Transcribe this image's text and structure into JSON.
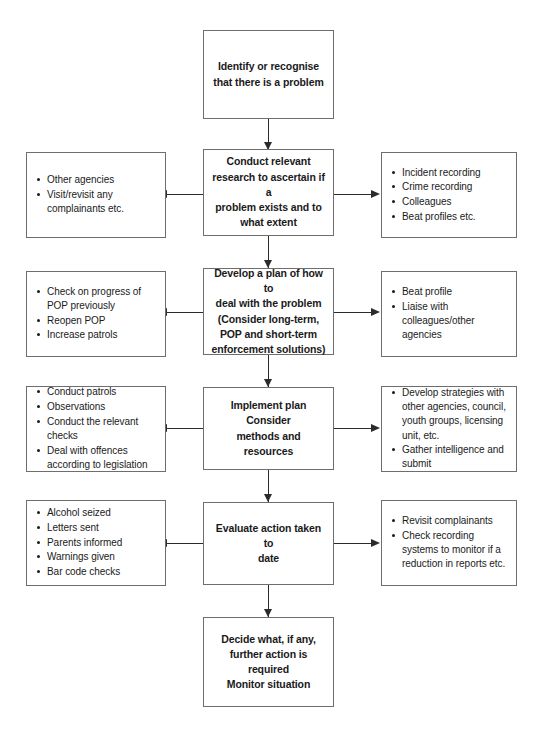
{
  "diagram": {
    "box_border_color": "#6e6e6e",
    "connector_color": "#2b2b2b",
    "background_color": "#ffffff"
  },
  "nodes": {
    "identify": {
      "lines": [
        "Identify or recognise",
        "that there is a problem"
      ]
    },
    "research": {
      "lines": [
        "Conduct relevant",
        "research to ascertain if a",
        "problem exists and to",
        "what extent"
      ]
    },
    "develop": {
      "lines": [
        "Develop a plan of how to",
        "deal with the problem",
        "(Consider long-term,",
        "POP and short-term",
        "enforcement solutions)"
      ]
    },
    "implement": {
      "lines": [
        "Implement plan",
        "Consider",
        "methods and resources"
      ]
    },
    "evaluate": {
      "lines": [
        "Evaluate action taken to",
        "date"
      ]
    },
    "decide": {
      "lines": [
        "Decide what, if any,",
        "further action is",
        "required",
        "Monitor situation"
      ]
    }
  },
  "left_boxes": {
    "research_left": {
      "items": [
        "Other agencies",
        "Visit/revisit any complainants etc."
      ]
    },
    "develop_left": {
      "items": [
        "Check on progress of POP previously",
        "Reopen POP",
        "Increase patrols"
      ]
    },
    "implement_left": {
      "items": [
        "Conduct patrols",
        "Observations",
        "Conduct the relevant checks",
        "Deal with offences according to legislation"
      ]
    },
    "evaluate_left": {
      "items": [
        "Alcohol seized",
        "Letters sent",
        "Parents informed",
        "Warnings given",
        "Bar code checks"
      ]
    }
  },
  "right_boxes": {
    "research_right": {
      "items": [
        "Incident recording",
        "Crime recording",
        "Colleagues",
        "Beat profiles etc."
      ]
    },
    "develop_right": {
      "items": [
        "Beat profile",
        "Liaise with colleagues/other agencies"
      ]
    },
    "implement_right": {
      "items": [
        "Develop strategies with other agencies, council, youth groups, licensing unit, etc.",
        "Gather intelligence and submit"
      ]
    },
    "evaluate_right": {
      "items": [
        "Revisit complainants",
        "Check recording systems to monitor if a reduction in reports etc."
      ]
    }
  }
}
